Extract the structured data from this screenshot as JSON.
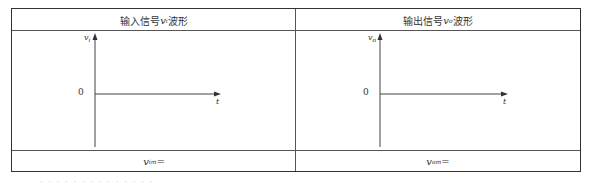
{
  "table": {
    "columns": [
      {
        "header_prefix": "输入信号 ",
        "header_symbol": "v",
        "header_subscript": "i",
        "header_suffix": "波形",
        "y_axis_label": "v",
        "y_axis_subscript": "i",
        "x_axis_label": "t",
        "origin_label": "0",
        "footer_symbol": "v",
        "footer_subscript": "im",
        "footer_suffix": "="
      },
      {
        "header_prefix": "输出信号 ",
        "header_symbol": "v",
        "header_subscript": "o",
        "header_suffix": "波形",
        "y_axis_label": "v",
        "y_axis_subscript": "o",
        "x_axis_label": "t",
        "origin_label": "0",
        "footer_symbol": "v",
        "footer_subscript": "om",
        "footer_suffix": "="
      }
    ]
  },
  "caption": "· · · · · · · · · · · · · ·"
}
